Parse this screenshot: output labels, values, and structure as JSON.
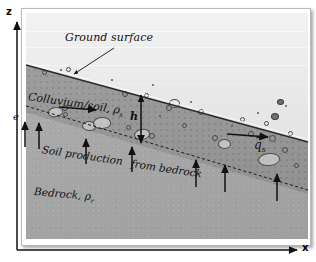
{
  "figure": {
    "axes": {
      "z_label": "z",
      "x_label": "x"
    },
    "labels": {
      "ground_surface": "Ground surface",
      "colluvium": "Colluvium/soil, ρ",
      "colluvium_sub": "s",
      "bedrock": "Bedrock, ρ",
      "bedrock_sub": "r",
      "soil_thickness": "h",
      "erosion_rate": "e",
      "soil_production_1": "Soil production",
      "soil_production_2": "from bedrock",
      "soil_flux": "q",
      "soil_flux_sub": "s",
      "soil_flux_accent": "~"
    },
    "colors": {
      "soil_fill": "#9a9a9a",
      "bedrock_fill": "#a9a9a9",
      "sky_fill": "#e9e9e9",
      "line": "#111111",
      "frame": "#b9b9b9"
    },
    "annotations": {
      "ground_surface_leader": "leader line from label to ground surface",
      "transport_arrow": "downslope soil transport direction",
      "production_arrows_count": 7,
      "thickness_arrow": "double-headed vertical arrow spanning soil layer"
    }
  }
}
